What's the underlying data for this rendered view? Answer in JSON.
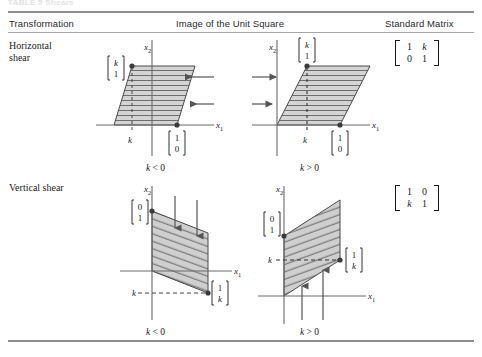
{
  "caption_ghost": "TABLE 5   Shears",
  "header": {
    "col_transformation": "Transformation",
    "col_image": "Image of the Unit Square",
    "col_matrix": "Standard Matrix"
  },
  "rows": [
    {
      "id": "horizontal-shear",
      "label_line1": "Horizontal",
      "label_line2": "shear",
      "matrix": {
        "r1c1": "1",
        "r1c2": "k",
        "r2c1": "0",
        "r2c2": "1"
      },
      "figures": [
        {
          "id": "horizontal-shear-k-negative",
          "caption_var": "k",
          "caption_rel": "< 0",
          "axis_x": "x",
          "axis_x_sub": "1",
          "axis_y": "x",
          "axis_y_sub": "2",
          "tick_label": "k",
          "vertex_label_top": {
            "top": "k",
            "bottom": "1"
          },
          "vertex_label_bottom": {
            "top": "1",
            "bottom": "0"
          },
          "arrow_direction": "left",
          "arrow_count": 2
        },
        {
          "id": "horizontal-shear-k-positive",
          "caption_var": "k",
          "caption_rel": "> 0",
          "axis_x": "x",
          "axis_x_sub": "1",
          "axis_y": "x",
          "axis_y_sub": "2",
          "tick_label": "k",
          "vertex_label_top": {
            "top": "k",
            "bottom": "1"
          },
          "vertex_label_bottom": {
            "top": "1",
            "bottom": "0"
          },
          "arrow_direction": "right",
          "arrow_count": 2
        }
      ]
    },
    {
      "id": "vertical-shear",
      "label_line1": "Vertical shear",
      "label_line2": "",
      "matrix": {
        "r1c1": "1",
        "r1c2": "0",
        "r2c1": "k",
        "r2c2": "1"
      },
      "figures": [
        {
          "id": "vertical-shear-k-negative",
          "caption_var": "k",
          "caption_rel": "< 0",
          "axis_x": "x",
          "axis_x_sub": "1",
          "axis_y": "x",
          "axis_y_sub": "2",
          "tick_label": "k",
          "vertex_label_top": {
            "top": "0",
            "bottom": "1"
          },
          "vertex_label_bottom": {
            "top": "1",
            "bottom": "k"
          },
          "arrow_direction": "down",
          "arrow_count": 2
        },
        {
          "id": "vertical-shear-k-positive",
          "caption_var": "k",
          "caption_rel": "> 0",
          "axis_x": "x",
          "axis_x_sub": "1",
          "axis_y": "x",
          "axis_y_sub": "2",
          "tick_label": "k",
          "vertex_label_top": {
            "top": "0",
            "bottom": "1"
          },
          "vertex_label_bottom": {
            "top": "1",
            "bottom": "k"
          },
          "arrow_direction": "up",
          "arrow_count": 2
        }
      ]
    }
  ],
  "colors": {
    "rule": "#8e8e8e",
    "axis": "#6b6b6b",
    "shape_fill": "#d2d2d2",
    "shape_stroke": "#4a4a4a",
    "hatch": "#6e6e6e",
    "text": "#1b1b1b",
    "arrow": "#555555"
  }
}
